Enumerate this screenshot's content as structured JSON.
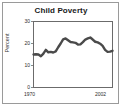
{
  "figure": {
    "title": "Child Poverty",
    "border_color": "#9a9a9a",
    "background": "#ffffff"
  },
  "axes": {
    "ylabel": "Percent",
    "ytick_labels": [
      "30",
      "20",
      "10",
      "0"
    ],
    "xtick_labels": [
      "1970",
      "2002"
    ],
    "axis_color": "#6b6b6b",
    "line_color": "#4a4a4a"
  },
  "chart_data": {
    "type": "line",
    "title": "Child Poverty",
    "xlabel": "",
    "ylabel": "Percent",
    "xlim": [
      1970,
      2002
    ],
    "ylim": [
      0,
      30
    ],
    "yticks": [
      0,
      10,
      20,
      30
    ],
    "xticks": [
      1970,
      2002
    ],
    "grid": false,
    "legend": "none",
    "series": [
      {
        "name": "Child Poverty Rate",
        "x": [
          1970,
          1971,
          1972,
          1973,
          1974,
          1975,
          1976,
          1977,
          1978,
          1979,
          1980,
          1981,
          1982,
          1983,
          1984,
          1985,
          1986,
          1987,
          1988,
          1989,
          1990,
          1991,
          1992,
          1993,
          1994,
          1995,
          1996,
          1997,
          1998,
          1999,
          2000,
          2001,
          2002
        ],
        "values": [
          15.0,
          15.1,
          15.0,
          14.2,
          15.4,
          17.1,
          16.0,
          16.2,
          15.9,
          16.4,
          18.3,
          20.0,
          21.9,
          22.3,
          21.5,
          20.7,
          20.5,
          20.3,
          19.5,
          19.6,
          20.6,
          21.8,
          22.3,
          22.7,
          21.8,
          20.8,
          20.5,
          19.9,
          18.9,
          17.1,
          16.2,
          16.3,
          16.7
        ]
      }
    ]
  }
}
